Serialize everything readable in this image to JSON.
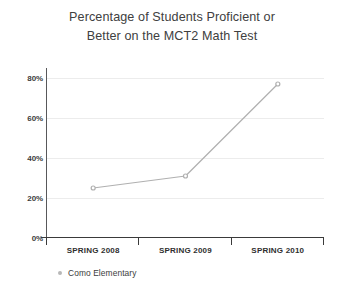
{
  "chart_data": {
    "type": "line",
    "title": "Percentage of Students Proficient or Better on the MCT2 Math Test",
    "title_lines": [
      "Percentage of Students Proficient or",
      "Better on the MCT2 Math Test"
    ],
    "categories": [
      "SPRING 2008",
      "SPRING 2009",
      "SPRING 2010"
    ],
    "series": [
      {
        "name": "Como Elementary",
        "values": [
          25,
          31,
          77
        ],
        "color": "#b0b0b0"
      }
    ],
    "xlabel": "",
    "ylabel": "",
    "ylim": [
      0,
      80
    ],
    "y_ticks": [
      0,
      20,
      40,
      60,
      80
    ],
    "y_tick_labels": [
      "0%",
      "20%",
      "40%",
      "60%",
      "80%"
    ],
    "grid": true,
    "legend_position": "bottom-left"
  },
  "legend": {
    "entries": [
      {
        "label": "Como Elementary",
        "marker": "legend-dot-marker"
      }
    ]
  },
  "colors": {
    "series": "#b0b0b0",
    "gridline": "#ececec",
    "axis": "#3a3a3a",
    "title_text": "#404040",
    "tick_text": "#3c3c3c",
    "background": "#ffffff"
  }
}
